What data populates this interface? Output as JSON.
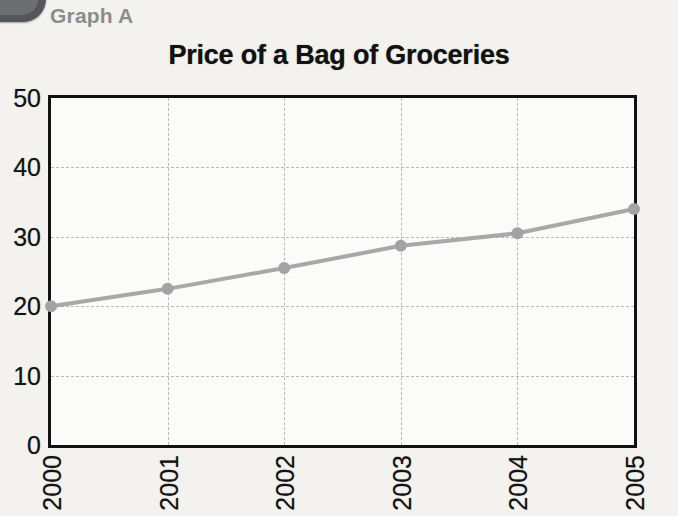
{
  "figure": {
    "label": "Graph A",
    "corner_marker_icon": "rounded-tab-icon"
  },
  "colors": {
    "background": "#f3f2ef",
    "plot_background": "#fbfbfa",
    "axis": "#111111",
    "gridline": "#b9b9b9",
    "series_line": "#a8a8a8",
    "series_marker": "#a3a3a3",
    "label_gray": "#8b8c8e",
    "title": "#121212"
  },
  "chart_data": {
    "type": "line",
    "title": "Price of a Bag of Groceries",
    "subtitle": "Graph A",
    "xlabel": "",
    "ylabel": "",
    "categories": [
      "2000",
      "2001",
      "2002",
      "2003",
      "2004",
      "2005"
    ],
    "values": [
      20,
      22.5,
      25.5,
      28.7,
      30.5,
      34
    ],
    "series": [
      {
        "name": "Price of a Bag of Groceries",
        "values": [
          20,
          22.5,
          25.5,
          28.7,
          30.5,
          34
        ]
      }
    ],
    "ylim": [
      0,
      50
    ],
    "yticks": [
      0,
      10,
      20,
      30,
      40,
      50
    ],
    "ytick_labels": [
      "0",
      "10",
      "20",
      "30",
      "40",
      "50"
    ],
    "xtick_labels": [
      "2000",
      "2001",
      "2002",
      "2003",
      "2004",
      "2005"
    ],
    "xtick_rotation": -90,
    "grid": true,
    "grid_style": "dotted",
    "legend": false,
    "markers": true,
    "marker_shape": "circle"
  }
}
